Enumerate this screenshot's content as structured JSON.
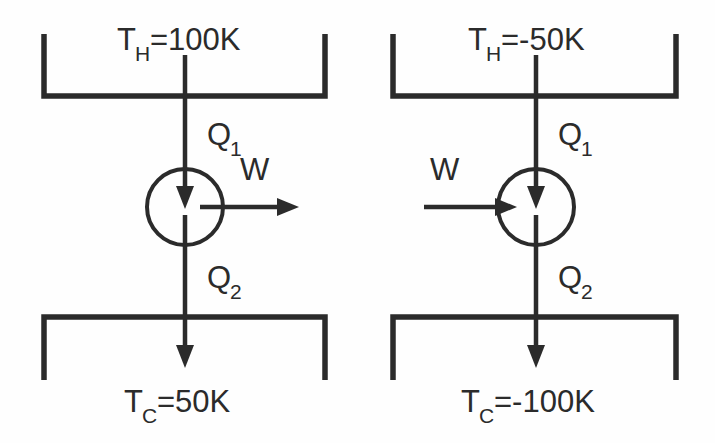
{
  "figure": {
    "type": "thermodynamic-cycle-diagram",
    "background_color": "#fefefe",
    "line_color": "#2b2b2b",
    "panel_count": 2
  },
  "panels": [
    {
      "id": "left",
      "role": "heat-engine",
      "hot_reservoir": {
        "label_main": "T",
        "label_sub": "H",
        "label_value": "=100K",
        "full_text": "T_H=100K"
      },
      "cold_reservoir": {
        "label_main": "T",
        "label_sub": "C",
        "label_value": "=50K",
        "full_text": "T_C=50K"
      },
      "heat_in": {
        "label_main": "Q",
        "label_sub": "1",
        "direction": "down"
      },
      "heat_out": {
        "label_main": "Q",
        "label_sub": "2",
        "direction": "down"
      },
      "work": {
        "label_main": "W",
        "direction": "right",
        "meaning": "work-output"
      }
    },
    {
      "id": "right",
      "role": "refrigerator-negative-temperature",
      "hot_reservoir": {
        "label_main": "T",
        "label_sub": "H",
        "label_value": "=-50K",
        "full_text": "T_H=-50K"
      },
      "cold_reservoir": {
        "label_main": "T",
        "label_sub": "C",
        "label_value": "=-100K",
        "full_text": "T_C=-100K"
      },
      "heat_in": {
        "label_main": "Q",
        "label_sub": "1",
        "direction": "down"
      },
      "heat_out": {
        "label_main": "Q",
        "label_sub": "2",
        "direction": "down"
      },
      "work": {
        "label_main": "W",
        "direction": "right",
        "meaning": "work-input"
      }
    }
  ]
}
